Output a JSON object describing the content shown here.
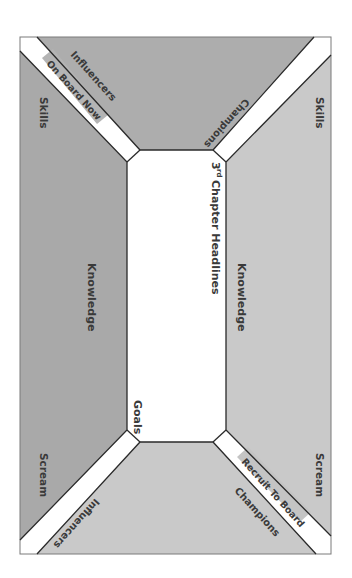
{
  "diagram": {
    "center": {
      "title": "Chapter Headlines",
      "title_prefix": "3",
      "title_superscript": "rd",
      "bottom_label": "Goals"
    },
    "regions": {
      "left": {
        "label": "Knowledge",
        "top_label": "Skills",
        "bottom_label": "Scream",
        "color": "#a9a9a9"
      },
      "right": {
        "label": "Knowledge",
        "top_label": "Skills",
        "bottom_label": "Scream",
        "color": "#c9c9c9"
      },
      "top": {
        "left_label": "Influencers",
        "right_label": "Champions",
        "color": "#adadad"
      },
      "bottom": {
        "left_label": "Influencers",
        "right_label": "Champions",
        "color": "#c9c9c9"
      }
    },
    "bands": {
      "top_left": {
        "label": "On Board Now",
        "highlight_color": "#b4b4b4"
      },
      "bottom_right": {
        "label": "Recruit To Board",
        "highlight_color": "#c4c4c4"
      }
    },
    "colors": {
      "outline": "#2a2a2a",
      "band_fill": "#ffffff",
      "center_fill": "#ffffff",
      "text": "#3a3a3a"
    }
  }
}
